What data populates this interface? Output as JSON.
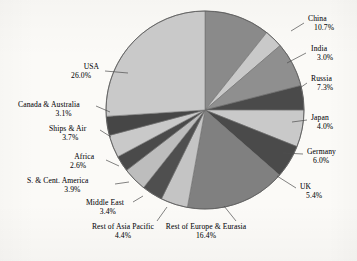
{
  "chart_data": {
    "type": "pie",
    "title": "",
    "subtitle": "",
    "xlabel": "",
    "ylabel": "",
    "legend_position": "callout-labels",
    "grid": false,
    "value_suffix": "%",
    "start_angle_deg": 0,
    "direction": "clockwise",
    "categories": [
      "China",
      "India",
      "Russia",
      "Japan",
      "Germany",
      "UK",
      "Rest of Europe & Eurasia",
      "Rest of Asia Pacific",
      "Middle East",
      "S. & Cent. America",
      "Africa",
      "Ships & Air",
      "Canada & Australia",
      "USA"
    ],
    "values": [
      10.7,
      3.0,
      7.3,
      4.0,
      6.0,
      5.4,
      16.4,
      4.4,
      3.4,
      3.9,
      2.6,
      3.7,
      3.1,
      26.0
    ],
    "value_labels": [
      "10.7%",
      "3.0%",
      "7.3%",
      "4.0%",
      "6.0%",
      "5.4%",
      "16.4%",
      "4.4%",
      "3.4%",
      "3.9%",
      "2.6%",
      "3.7%",
      "3.1%",
      "26.0%"
    ],
    "slice_colors": [
      "#8a8a8a",
      "#c9c9c9",
      "#8f8f8f",
      "#4a4a4a",
      "#c9c9c9",
      "#4a4a4a",
      "#808080",
      "#c4c4c4",
      "#4f4f4f",
      "#bdbdbd",
      "#4a4a4a",
      "#c9c9c9",
      "#464646",
      "#c9c9c9"
    ]
  },
  "colors": {
    "background": "#fbfaf7",
    "light_gray": "#c9c9c9",
    "medium_gray": "#8a8a8a",
    "dark_gray": "#4a4a4a",
    "slice_outline": "#6e6e6e",
    "leader_line": "#4d4d4d",
    "text": "#16161a"
  },
  "labels": [
    {
      "name": "China",
      "value": "10.7%",
      "align": "right",
      "x": 308,
      "y": 14,
      "anchor_x": 291,
      "anchor_y": 31,
      "line_x": 304,
      "line_y": 23
    },
    {
      "name": "India",
      "value": "3.0%",
      "align": "right",
      "x": 311,
      "y": 44,
      "anchor_x": 287,
      "anchor_y": 63,
      "line_x": 306,
      "line_y": 53
    },
    {
      "name": "Russia",
      "value": "7.3%",
      "align": "right",
      "x": 311,
      "y": 74,
      "anchor_x": 297,
      "anchor_y": 90,
      "line_x": 307,
      "line_y": 83
    },
    {
      "name": "Japan",
      "value": "4.0%",
      "align": "right",
      "x": 311,
      "y": 113,
      "anchor_x": 292,
      "anchor_y": 122,
      "line_x": 307,
      "line_y": 120
    },
    {
      "name": "Germany",
      "value": "6.0%",
      "align": "right",
      "x": 307,
      "y": 147,
      "anchor_x": 283,
      "anchor_y": 153,
      "line_x": 303,
      "line_y": 154
    },
    {
      "name": "UK",
      "value": "5.4%",
      "align": "right",
      "x": 300,
      "y": 182,
      "anchor_x": 277,
      "anchor_y": 176,
      "line_x": 296,
      "line_y": 188
    },
    {
      "name": "Rest of Europe & Eurasia",
      "value": "16.4%",
      "align": "center",
      "x": 206,
      "y": 222,
      "anchor_x": 224,
      "anchor_y": 206,
      "line_x": 236,
      "line_y": 221
    },
    {
      "name": "Rest of Asia Pacific",
      "value": "4.4%",
      "align": "center",
      "x": 123,
      "y": 222,
      "anchor_x": 167,
      "anchor_y": 207,
      "line_x": 157,
      "line_y": 221
    },
    {
      "name": "Middle East",
      "value": "3.4%",
      "align": "left",
      "x": 86,
      "y": 198,
      "anchor_x": 143,
      "anchor_y": 196,
      "line_x": 133,
      "line_y": 202
    },
    {
      "name": "S. & Cent. America",
      "value": "3.9%",
      "align": "left",
      "x": 27,
      "y": 176,
      "anchor_x": 129,
      "anchor_y": 182,
      "line_x": 115,
      "line_y": 184
    },
    {
      "name": "Africa",
      "value": "2.6%",
      "align": "left",
      "x": 70,
      "y": 152,
      "anchor_x": 119,
      "anchor_y": 166,
      "line_x": 106,
      "line_y": 160
    },
    {
      "name": "Ships & Air",
      "value": "3.7%",
      "align": "left",
      "x": 49,
      "y": 124,
      "anchor_x": 111,
      "anchor_y": 137,
      "line_x": 100,
      "line_y": 130
    },
    {
      "name": "Canada & Australia",
      "value": "3.1%",
      "align": "left",
      "x": 18,
      "y": 100,
      "anchor_x": 110,
      "anchor_y": 112,
      "line_x": 96,
      "line_y": 106
    },
    {
      "name": "USA",
      "value": "26.0%",
      "align": "left",
      "x": 71,
      "y": 62,
      "anchor_x": 128,
      "anchor_y": 73,
      "line_x": 105,
      "line_y": 71
    }
  ]
}
